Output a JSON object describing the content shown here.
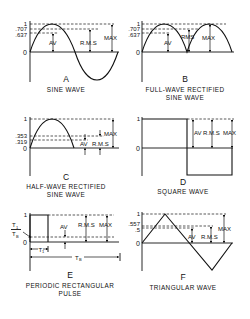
{
  "figure": {
    "panels": [
      {
        "letter": "A",
        "title_lines": [
          "SINE WAVE"
        ],
        "y_ticks": [
          "1",
          ".707",
          ".637",
          "0"
        ],
        "measures": [
          "AV",
          "R.M.S",
          "MAX"
        ]
      },
      {
        "letter": "B",
        "title_lines": [
          "FULL-WAVE RECTIFIED",
          "SINE WAVE"
        ],
        "y_ticks": [
          "1",
          ".707",
          ".637",
          "0"
        ],
        "measures": [
          "AV",
          "RMS",
          "MAX"
        ]
      },
      {
        "letter": "C",
        "title_lines": [
          "HALF-WAVE RECTIFIED",
          "SINE WAVE"
        ],
        "y_ticks": [
          "1",
          ".353",
          ".319",
          "0"
        ],
        "measures": [
          "AV",
          "R.M.S",
          "MAX"
        ]
      },
      {
        "letter": "D",
        "title_lines": [
          "SQUARE WAVE"
        ],
        "y_ticks": [
          "1",
          "0"
        ],
        "measures": [
          "AV",
          "R.M.S",
          "MAX"
        ]
      },
      {
        "letter": "E",
        "title_lines": [
          "PERIODIC RECTANGULAR",
          "PULSE"
        ],
        "y_ticks": [
          "1",
          "0"
        ],
        "ratio_num": "T",
        "ratio_num_sub": "1",
        "ratio_den": "T",
        "ratio_den_sub": "B",
        "t1_label": "T",
        "t1_sub": "1",
        "tb_label": "T",
        "tb_sub": "B",
        "measures": [
          "AV",
          "R.M.S",
          "MAX"
        ]
      },
      {
        "letter": "F",
        "title_lines": [
          "TRIANGULAR WAVE"
        ],
        "y_ticks": [
          "1",
          ".557",
          ".5",
          "0"
        ],
        "measures": [
          "AV",
          "R.M.S",
          "MAX"
        ]
      }
    ]
  }
}
